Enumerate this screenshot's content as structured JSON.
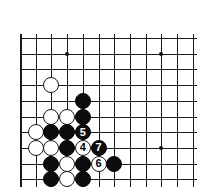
{
  "figure": {
    "kind": "go-board-diagram",
    "colors": {
      "background": "#ffffff",
      "line": "#1a1a1a",
      "black_stone": "#0d0d0d",
      "white_stone": "#ffffff",
      "black_label": "#ffffff",
      "white_label": "#000000"
    }
  },
  "board": {
    "origin_x": 20,
    "origin_y": 38,
    "spacing": 15.7,
    "columns": 12,
    "rows": 10,
    "stone_diameter": 16,
    "line_overhang": 4,
    "star_points": [
      {
        "name": "star-point-upper-left",
        "col": 3,
        "row": 1
      },
      {
        "name": "star-point-upper-right",
        "col": 9,
        "row": 1
      },
      {
        "name": "star-point-lower-right",
        "col": 9,
        "row": 7
      }
    ],
    "stones": [
      {
        "name": "white-stone-c4",
        "color": "white",
        "col": 2,
        "row": 3,
        "label": ""
      },
      {
        "name": "black-stone-e5",
        "color": "black",
        "col": 4,
        "row": 4,
        "label": ""
      },
      {
        "name": "white-stone-c6",
        "color": "white",
        "col": 2,
        "row": 5,
        "label": ""
      },
      {
        "name": "white-stone-d6",
        "color": "white",
        "col": 3,
        "row": 5,
        "label": ""
      },
      {
        "name": "black-stone-e6",
        "color": "black",
        "col": 4,
        "row": 5,
        "label": ""
      },
      {
        "name": "white-stone-b7",
        "color": "white",
        "col": 1,
        "row": 6,
        "label": ""
      },
      {
        "name": "black-stone-c7",
        "color": "black",
        "col": 2,
        "row": 6,
        "label": ""
      },
      {
        "name": "black-stone-d7",
        "color": "black",
        "col": 3,
        "row": 6,
        "label": ""
      },
      {
        "name": "black-stone-move-5",
        "color": "black",
        "col": 4,
        "row": 6,
        "label": "5"
      },
      {
        "name": "white-stone-b8",
        "color": "white",
        "col": 1,
        "row": 7,
        "label": ""
      },
      {
        "name": "white-stone-c8",
        "color": "white",
        "col": 2,
        "row": 7,
        "label": ""
      },
      {
        "name": "black-stone-d8",
        "color": "black",
        "col": 3,
        "row": 7,
        "label": ""
      },
      {
        "name": "white-stone-move-4",
        "color": "white",
        "col": 4,
        "row": 7,
        "label": "4"
      },
      {
        "name": "black-stone-move-7",
        "color": "black",
        "col": 5,
        "row": 7,
        "label": "7"
      },
      {
        "name": "black-stone-c9",
        "color": "black",
        "col": 2,
        "row": 8,
        "label": ""
      },
      {
        "name": "white-stone-d9",
        "color": "white",
        "col": 3,
        "row": 8,
        "label": ""
      },
      {
        "name": "black-stone-e9",
        "color": "black",
        "col": 4,
        "row": 8,
        "label": ""
      },
      {
        "name": "white-stone-move-6",
        "color": "white",
        "col": 5,
        "row": 8,
        "label": "6"
      },
      {
        "name": "black-stone-g9",
        "color": "black",
        "col": 6,
        "row": 8,
        "label": ""
      },
      {
        "name": "black-stone-c10",
        "color": "black",
        "col": 2,
        "row": 9,
        "label": ""
      },
      {
        "name": "white-stone-d10",
        "color": "white",
        "col": 3,
        "row": 9,
        "label": ""
      },
      {
        "name": "black-stone-e10",
        "color": "black",
        "col": 4,
        "row": 9,
        "label": ""
      }
    ],
    "move_sequence": [
      {
        "number": "4",
        "color": "white"
      },
      {
        "number": "5",
        "color": "black"
      },
      {
        "number": "6",
        "color": "white"
      },
      {
        "number": "7",
        "color": "black"
      }
    ]
  }
}
